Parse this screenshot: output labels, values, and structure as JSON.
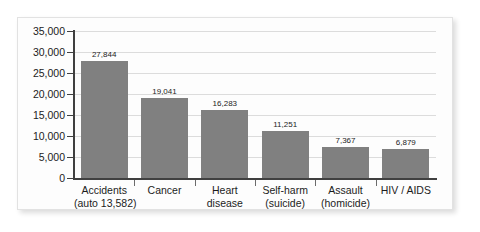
{
  "chart_data": {
    "type": "bar",
    "title": "",
    "subtitle": "",
    "xlabel": "",
    "ylabel": "",
    "ylim": [
      0,
      35000
    ],
    "grid": true,
    "legend": false,
    "legend_position": "none",
    "orientation": "vertical",
    "bar_color": "#808080",
    "categories": [
      "Accidents (auto 13,582)",
      "Cancer",
      "Heart disease",
      "Self-harm (suicide)",
      "Assault (homicide)",
      "HIV / AIDS"
    ],
    "category_lines": [
      [
        "Accidents",
        "(auto 13,582)"
      ],
      [
        "Cancer",
        ""
      ],
      [
        "Heart",
        "disease"
      ],
      [
        "Self-harm",
        "(suicide)"
      ],
      [
        "Assault",
        "(homicide)"
      ],
      [
        "HIV / AIDS",
        ""
      ]
    ],
    "values": [
      27844,
      19041,
      16283,
      11251,
      7367,
      6879
    ],
    "value_labels": [
      "27,844",
      "19,041",
      "16,283",
      "11,251",
      "7,367",
      "6,879"
    ],
    "yticks": [
      0,
      5000,
      10000,
      15000,
      20000,
      25000,
      30000,
      35000
    ],
    "ytick_labels": [
      "0",
      "5,000",
      "10,000",
      "15,000",
      "20,000",
      "25,000",
      "30,000",
      "35,000"
    ]
  },
  "style": {
    "background": "#ffffff",
    "frame_background": "#fdfdfd",
    "frame_border": "#e2e2e2",
    "gridline_color": "#dcdcdc",
    "axis_color": "#404040",
    "text_color": "#1c1c1c"
  }
}
